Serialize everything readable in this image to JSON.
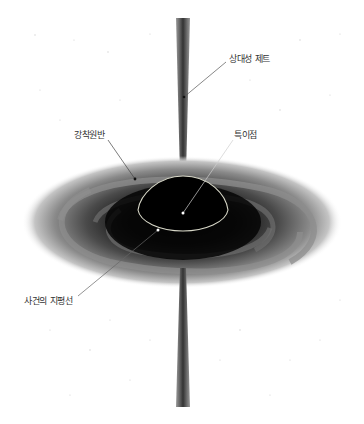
{
  "diagram": {
    "labels": {
      "jet": "상대성 제트",
      "accretion_disk": "강착원반",
      "singularity": "특이점",
      "event_horizon": "사건의 지평선"
    },
    "colors": {
      "background": "#ffffff",
      "disk_outer": "#9a9a9a",
      "disk_mid": "#5c5c5c",
      "disk_core": "#0a0a0a",
      "jet": "#555555",
      "horizon_outline": "#d8d8c8",
      "leader_line": "#444444",
      "label_text": "#333333"
    }
  }
}
